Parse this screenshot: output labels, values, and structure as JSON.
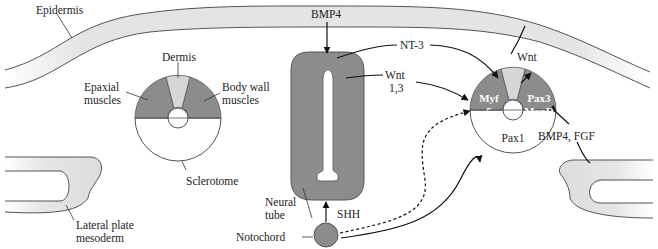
{
  "colors": {
    "dark_tissue": "#8c8c8c",
    "light_tissue": "#d4d4d4",
    "epidermis_fill": "#e6e6e6",
    "outline": "#555555",
    "arrow": "#111111"
  },
  "labels": {
    "epidermis": "Epidermis",
    "dermis": "Dermis",
    "epaxial_1": "Epaxial",
    "epaxial_2": "muscles",
    "bodywall_1": "Body wall",
    "bodywall_2": "muscles",
    "sclerotome": "Sclerotome",
    "lateral_1": "Lateral plate",
    "lateral_2": "mesoderm",
    "neural_1": "Neural",
    "neural_2": "tube",
    "notochord": "Notochord",
    "bmp4_top": "BMP4",
    "nt3": "NT-3",
    "wnt13_1": "Wnt",
    "wnt13_2": "1,3",
    "wnt_right": "Wnt",
    "shh": "SHH",
    "bmp4_fgf": "BMP4, FGF",
    "myf5_1": "Myf",
    "myf5_2": "5",
    "pax3": "Pax3",
    "myod": "MyoD",
    "pax1": "Pax1"
  }
}
